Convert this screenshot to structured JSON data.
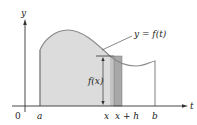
{
  "diagram": {
    "axes": {
      "x_label": "t",
      "y_label": "y",
      "origin_label": "0"
    },
    "curve_label": "y = f(t)",
    "height_label": "f(x)",
    "tick_labels": {
      "a": "a",
      "x": "x",
      "x_plus_h": "x + h",
      "b": "b"
    },
    "colors": {
      "region_fill": "#dcdcdc",
      "strip_light": "#c4c4c4",
      "strip_dark": "#9c9c9c",
      "curve": "#8a8a8a",
      "axis": "#333333",
      "text": "#222222"
    }
  }
}
